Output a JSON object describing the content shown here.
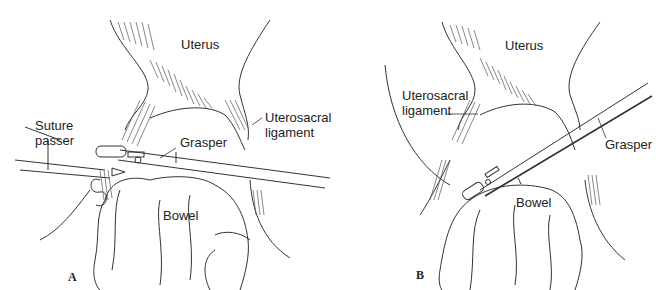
{
  "figure": {
    "panels": [
      {
        "id": "A",
        "label": "A",
        "annotations": {
          "uterus": "Uterus",
          "uterosacral": [
            "Uterosacral",
            "ligament"
          ],
          "suture_passer": [
            "Suture",
            "passer"
          ],
          "grasper": "Grasper",
          "bowel": "Bowel"
        }
      },
      {
        "id": "B",
        "label": "B",
        "annotations": {
          "uterus": "Uterus",
          "uterosacral": [
            "Uterosacral",
            "ligament"
          ],
          "grasper": "Grasper",
          "bowel": "Bowel"
        }
      }
    ],
    "caption_truncated": ""
  },
  "colors": {
    "line": "#333333",
    "hatch": "#555555",
    "text": "#222222",
    "background": "#ffffff"
  }
}
